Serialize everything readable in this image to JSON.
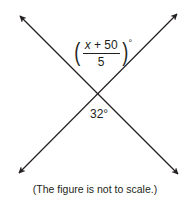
{
  "diagram": {
    "type": "intersecting-lines",
    "lines": [
      {
        "name": "line-descending",
        "from": {
          "x": 20,
          "y": 16
        },
        "to": {
          "x": 178,
          "y": 174
        },
        "arrows": "both"
      },
      {
        "name": "line-ascending",
        "from": {
          "x": 19,
          "y": 173
        },
        "to": {
          "x": 177,
          "y": 14
        },
        "arrows": "both"
      }
    ],
    "intersection": {
      "x": 97,
      "y": 94
    },
    "line_color": "#231f20",
    "angles": {
      "top": {
        "expression": {
          "numerator_variable": "x",
          "numerator_rest": " + 50",
          "denominator": "5",
          "open_paren": "(",
          "close_paren": ")",
          "degree": "°"
        },
        "position": "above intersection"
      },
      "bottom": {
        "label": "32°",
        "position": "below intersection"
      }
    },
    "caption": "(The figure is not to scale.)"
  }
}
